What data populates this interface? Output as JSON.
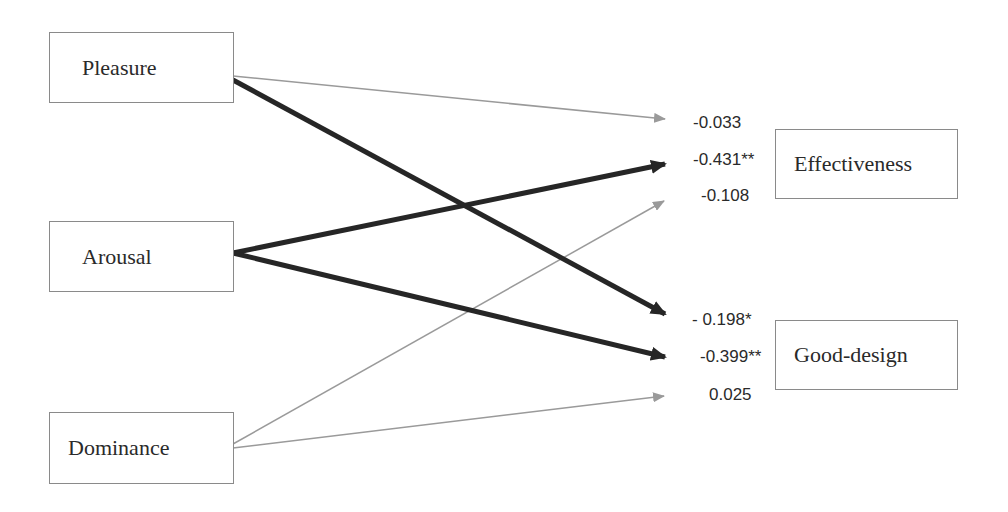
{
  "diagram": {
    "type": "path-model",
    "inputs": [
      {
        "id": "pleasure",
        "label": "Pleasure"
      },
      {
        "id": "arousal",
        "label": "Arousal"
      },
      {
        "id": "dominance",
        "label": "Dominance"
      }
    ],
    "outputs": [
      {
        "id": "effectiveness",
        "label": "Effectiveness"
      },
      {
        "id": "good_design",
        "label": "Good-design"
      }
    ],
    "paths": [
      {
        "from": "pleasure",
        "to": "effectiveness",
        "coefficient": "-0.033",
        "significant": false
      },
      {
        "from": "arousal",
        "to": "effectiveness",
        "coefficient": "-0.431**",
        "significant": true
      },
      {
        "from": "dominance",
        "to": "effectiveness",
        "coefficient": "-0.108",
        "significant": false
      },
      {
        "from": "pleasure",
        "to": "good_design",
        "coefficient": "- 0.198*",
        "significant": true
      },
      {
        "from": "arousal",
        "to": "good_design",
        "coefficient": "-0.399**",
        "significant": true
      },
      {
        "from": "dominance",
        "to": "good_design",
        "coefficient": "0.025",
        "significant": false
      }
    ],
    "colors": {
      "significant": "#262626",
      "nonsignificant": "#9a9a9a",
      "border": "#8a8a8a"
    }
  }
}
